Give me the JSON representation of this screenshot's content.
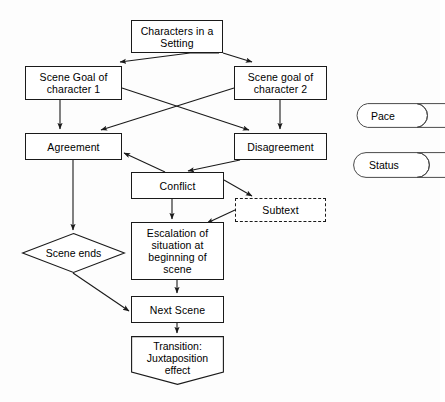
{
  "diagram": {
    "stroke_color": "#1a1a1a",
    "fill_color": "#ffffff",
    "background_color": "#fdfdfd",
    "nodes": [
      {
        "id": "characters",
        "label": "Characters in a\nSetting",
        "shape": "rect",
        "x": 131,
        "y": 20,
        "w": 92,
        "h": 33
      },
      {
        "id": "goal1",
        "label": "Scene Goal of\ncharacter 1",
        "shape": "rect",
        "x": 25,
        "y": 66,
        "w": 97,
        "h": 34
      },
      {
        "id": "goal2",
        "label": "Scene goal of\ncharacter 2",
        "shape": "rect",
        "x": 234,
        "y": 66,
        "w": 93,
        "h": 34
      },
      {
        "id": "agreement",
        "label": "Agreement",
        "shape": "rect",
        "x": 25,
        "y": 133,
        "w": 97,
        "h": 27
      },
      {
        "id": "disagreement",
        "label": "Disagreement",
        "shape": "rect",
        "x": 234,
        "y": 133,
        "w": 93,
        "h": 27
      },
      {
        "id": "conflict",
        "label": "Conflict",
        "shape": "rect",
        "x": 131,
        "y": 172,
        "w": 93,
        "h": 27
      },
      {
        "id": "subtext",
        "label": "Subtext",
        "shape": "rect-dashed",
        "x": 235,
        "y": 198,
        "w": 91,
        "h": 24
      },
      {
        "id": "escalation",
        "label": "Escalation of\nsituation at\nbeginning of\nscene",
        "shape": "rect",
        "x": 131,
        "y": 222,
        "w": 93,
        "h": 58
      },
      {
        "id": "sceneends",
        "label": "Scene ends",
        "shape": "diamond",
        "x": 22,
        "y": 233,
        "w": 103,
        "h": 40
      },
      {
        "id": "nextscene",
        "label": "Next Scene",
        "shape": "rect",
        "x": 131,
        "y": 296,
        "w": 93,
        "h": 27
      },
      {
        "id": "transition",
        "label": "Transition:\nJuxtaposition\neffect",
        "shape": "pentagon-down",
        "x": 131,
        "y": 336,
        "w": 93,
        "h": 49
      }
    ],
    "side_shapes": [
      {
        "id": "pace",
        "label": "Pace",
        "shape": "delay",
        "x": 355,
        "y": 103,
        "w": 90,
        "h": 25
      },
      {
        "id": "status",
        "label": "Status",
        "shape": "delay",
        "x": 353,
        "y": 152,
        "w": 92,
        "h": 26
      }
    ],
    "edges": [
      {
        "id": "characters-to-goal1",
        "from": "characters",
        "to": "goal1",
        "points": "219,53 190,53 120,62",
        "arrow": true
      },
      {
        "id": "characters-to-goal2",
        "from": "characters",
        "to": "goal2",
        "points": "223,53 252,62",
        "arrow": true
      },
      {
        "id": "goal1-to-agreement",
        "from": "goal1",
        "to": "agreement",
        "points": "60,100 60,129",
        "arrow": true
      },
      {
        "id": "goal2-to-disagreement",
        "from": "goal2",
        "to": "disagreement",
        "points": "280,100 280,129",
        "arrow": true
      },
      {
        "id": "goal1-to-disagreement",
        "from": "goal1",
        "to": "disagreement",
        "points": "122,88 249,130",
        "arrow": true
      },
      {
        "id": "goal2-to-agreement",
        "from": "goal2",
        "to": "agreement",
        "points": "234,88 101,130",
        "arrow": true
      },
      {
        "id": "disagreement-to-conflict",
        "from": "disagreement",
        "to": "conflict",
        "points": "240,160 188,171",
        "arrow": true
      },
      {
        "id": "conflict-to-agreement",
        "from": "conflict",
        "to": "agreement",
        "points": "165,172 124,153",
        "arrow": true
      },
      {
        "id": "agreement-to-sceneends",
        "from": "agreement",
        "to": "sceneends",
        "points": "73,160 73,230",
        "arrow": true
      },
      {
        "id": "conflict-to-subtext",
        "from": "conflict",
        "to": "subtext",
        "points": "224,180 252,196",
        "arrow": true
      },
      {
        "id": "conflict-to-escalation",
        "from": "conflict",
        "to": "escalation",
        "points": "172,199 172,219",
        "arrow": true
      },
      {
        "id": "subtext-to-escalation",
        "from": "subtext",
        "to": "escalation",
        "points": "235,210 207,223",
        "arrow": true
      },
      {
        "id": "sceneends-to-nextscene",
        "from": "sceneends",
        "to": "nextscene",
        "points": "73,273 129,311",
        "arrow": true
      },
      {
        "id": "escalation-to-nextscene",
        "from": "escalation",
        "to": "nextscene",
        "points": "177,280 177,293",
        "arrow": true
      },
      {
        "id": "nextscene-to-transition",
        "from": "nextscene",
        "to": "transition",
        "points": "177,323 177,333",
        "arrow": true
      }
    ]
  }
}
